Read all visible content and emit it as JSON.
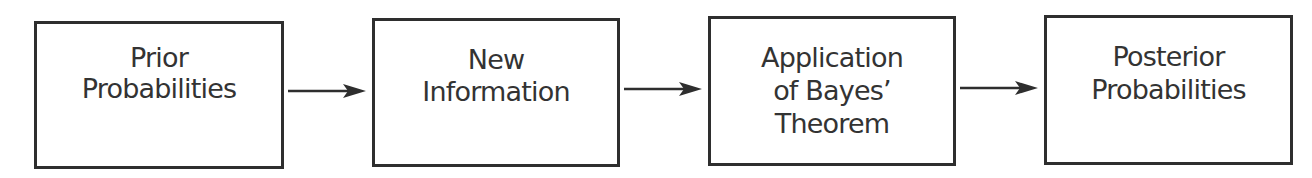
{
  "diagram": {
    "type": "flowchart",
    "boxes": [
      {
        "id": "prior",
        "lines": [
          "Prior",
          "Probabilities"
        ]
      },
      {
        "id": "new-info",
        "lines": [
          "New",
          "Information"
        ]
      },
      {
        "id": "bayes",
        "lines": [
          "Application",
          "of Bayes’",
          "Theorem"
        ]
      },
      {
        "id": "posterior",
        "lines": [
          "Posterior",
          "Probabilities"
        ]
      }
    ],
    "edges": [
      {
        "from": "prior",
        "to": "new-info"
      },
      {
        "from": "new-info",
        "to": "bayes"
      },
      {
        "from": "bayes",
        "to": "posterior"
      }
    ],
    "colors": {
      "stroke": "#2e2e2e",
      "text": "#333333",
      "background": "#ffffff"
    }
  }
}
